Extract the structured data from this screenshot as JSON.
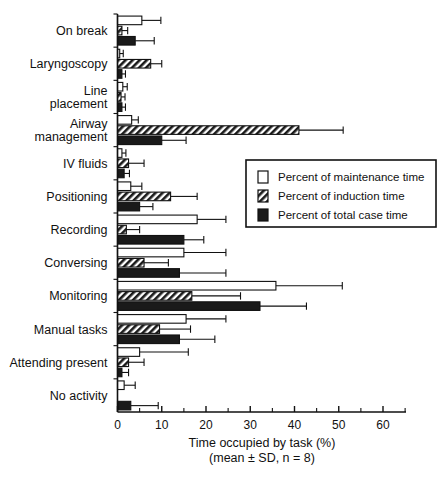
{
  "chart_data": {
    "type": "bar",
    "orientation": "horizontal",
    "title": "",
    "xlabel": "Time occupied by task (%)",
    "xlabel_sub": "(mean ± SD, n = 8)",
    "ylabel": "",
    "xlim": [
      0,
      65
    ],
    "xticks": [
      0,
      10,
      20,
      30,
      40,
      50,
      60
    ],
    "xticklabels": [
      "0",
      "10",
      "20",
      "30",
      "40",
      "50",
      "60"
    ],
    "grid": false,
    "legend_position": "center-right",
    "error_type": "SD",
    "n": 8,
    "categories": [
      "On break",
      "Laryngoscopy",
      "Line placement",
      "Airway management",
      "IV fluids",
      "Positioning",
      "Recording",
      "Conversing",
      "Monitoring",
      "Manual tasks",
      "Attending present",
      "No activity"
    ],
    "category_label_lines": [
      [
        "On break"
      ],
      [
        "Laryngoscopy"
      ],
      [
        "Line",
        "placement"
      ],
      [
        "Airway",
        "management"
      ],
      [
        "IV fluids"
      ],
      [
        "Positioning"
      ],
      [
        "Recording"
      ],
      [
        "Conversing"
      ],
      [
        "Monitoring"
      ],
      [
        "Manual tasks"
      ],
      [
        "Attending present"
      ],
      [
        "No activity"
      ]
    ],
    "series": [
      {
        "name": "Percent of maintenance time",
        "style": "white",
        "values": [
          5.5,
          0.5,
          1.2,
          3.2,
          1.0,
          3.0,
          18.0,
          15.0,
          35.8,
          15.5,
          5.0,
          1.5
        ],
        "errors": [
          4.3,
          0.8,
          1.0,
          1.5,
          0.9,
          2.5,
          6.5,
          9.5,
          15.0,
          9.0,
          11.0,
          2.5
        ]
      },
      {
        "name": "Percent of induction time",
        "style": "hatched",
        "values": [
          1.0,
          7.5,
          0.8,
          41.0,
          2.5,
          12.0,
          2.0,
          6.0,
          16.8,
          9.5,
          2.5,
          0.0
        ],
        "errors": [
          1.3,
          2.5,
          0.9,
          10.0,
          3.5,
          6.0,
          3.0,
          5.5,
          11.0,
          7.0,
          3.5,
          0.0
        ]
      },
      {
        "name": "Percent of total case time",
        "style": "black",
        "values": [
          4.0,
          1.0,
          1.0,
          10.0,
          1.5,
          5.0,
          15.0,
          14.0,
          32.2,
          14.0,
          1.0,
          3.0
        ],
        "errors": [
          4.3,
          0.8,
          0.8,
          5.5,
          1.2,
          3.0,
          4.5,
          10.5,
          10.5,
          8.0,
          1.5,
          6.2
        ]
      }
    ],
    "legend_entries": [
      "Percent of maintenance time",
      "Percent of induction time",
      "Percent of total case time"
    ],
    "colors": {
      "maintenance": "#ffffff",
      "induction": "#808080",
      "total_case": "#1a1a1a",
      "axis": "#111111"
    }
  }
}
